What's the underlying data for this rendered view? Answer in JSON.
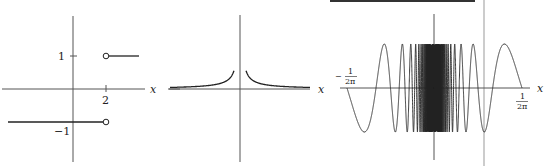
{
  "figures": [
    {
      "id": "step-function",
      "axis_label_x": "x",
      "y_ticks": [
        {
          "value": 1,
          "label": "1"
        },
        {
          "value": -1,
          "label": "−1"
        }
      ],
      "x_ticks": [
        {
          "value": 2,
          "label": "2"
        }
      ],
      "segments": [
        {
          "from": "-inf",
          "to": 2,
          "y": -1,
          "endpoint": "open"
        },
        {
          "from": 2,
          "to": "+inf",
          "y": 1,
          "endpoint": "open"
        }
      ]
    },
    {
      "id": "inverse-abs-function",
      "axis_label_x": "x",
      "description": "symmetric curve with vertical asymptote at x=0, approaching 0 as |x| grows"
    },
    {
      "id": "oscillating-function",
      "axis_label_x": "x",
      "x_ticks": [
        {
          "label_sign": "−",
          "numerator": "1",
          "denominator": "2π"
        },
        {
          "label_sign": "",
          "numerator": "1",
          "denominator": "2π"
        }
      ],
      "description": "sin(1/x)-like oscillation accumulating near x=0 on interval [−1/2π, 1/2π]"
    }
  ],
  "colors": {
    "axis": "#555555",
    "curve": "#222222",
    "background": "#ffffff",
    "top_bar": "#333333",
    "right_line": "#bbbbbb"
  }
}
